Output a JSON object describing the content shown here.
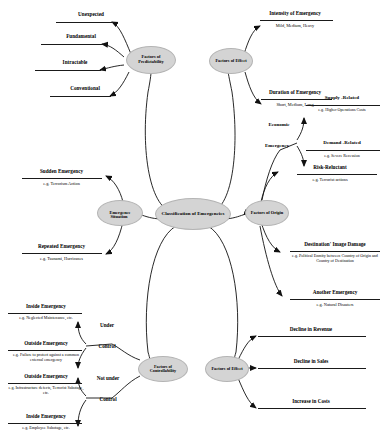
{
  "diagram": {
    "title": "Classification of Emergencies",
    "center": {
      "label": "Classification of Emergencies"
    },
    "branches": {
      "predictability": {
        "node": "Factors of Predictability",
        "items": [
          {
            "label": "Unexpected"
          },
          {
            "label": "Fundamental"
          },
          {
            "label": "Intractable"
          },
          {
            "label": "Conventional"
          }
        ]
      },
      "effect_top": {
        "node": "Factors of Effect",
        "items": [
          {
            "label": "Intensity of Emergency",
            "example": "Mild, Medium, Heavy"
          },
          {
            "label": "Duration of Emergency",
            "example": "Short, Medium, Long"
          }
        ]
      },
      "economic": {
        "node_line1": "Economic",
        "node_line2": "Emergency",
        "items": [
          {
            "label": "Supply -Related",
            "example": "e.g. Higher Operations Costs"
          },
          {
            "label": "Demand -Related",
            "example": "e.g. Severe Recession"
          }
        ]
      },
      "origin": {
        "node": "Factors of Origin",
        "items": [
          {
            "label": "Risk-Reluctant",
            "example": "e.g. Terrorist actions"
          },
          {
            "label": "Destination' Image Damage",
            "example": "e.g. Political Enmity between Country of Origin and Country of Destination"
          },
          {
            "label": "Another Emergency",
            "example": "e.g. Natural Disasters"
          }
        ]
      },
      "emergence": {
        "node_line1": "Emergence",
        "node_line2": "Situation",
        "items": [
          {
            "label": "Sudden Emergency",
            "example": "e.g. Terrorism Action"
          },
          {
            "label": "Repeated Emergency",
            "example": "e.g. Tsunami, Hurricanes"
          }
        ]
      },
      "controllability": {
        "node": "Factors of Controllability",
        "groups": [
          {
            "label_line1": "Under",
            "label_line2": "Control",
            "items": [
              {
                "label": "Inside Emergency",
                "example": "e.g. Neglected Maintenance, etc."
              },
              {
                "label": "Outside Emergency",
                "example": "e.g. Failure to protect against a common external emergency"
              }
            ]
          },
          {
            "label_line1": "Not under",
            "label_line2": "Control",
            "items": [
              {
                "label": "Outside Emergency",
                "example": "e.g. Infrastructure defects, Terrorist Sabotage, etc."
              },
              {
                "label": "Inside Emergency",
                "example": "e.g. Employee Sabotage, etc."
              }
            ]
          }
        ]
      },
      "effect_bottom": {
        "node": "Factors of Effect",
        "items": [
          {
            "label": "Decline in Revenue"
          },
          {
            "label": "Decline in Sales"
          },
          {
            "label": "Increase in Costs"
          }
        ]
      }
    },
    "style": {
      "node_fill": "#d4d4d4",
      "line_color": "#1a1a1a",
      "text_color": "#000000"
    }
  }
}
